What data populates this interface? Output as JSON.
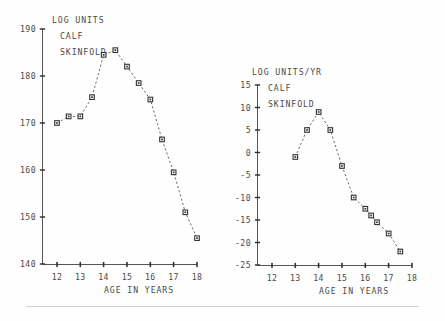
{
  "figure": {
    "background_color": "#fefefe",
    "ink_color": "#4a4a4a",
    "marker_color": "#333333",
    "footer_rule": true
  },
  "chart_data": [
    {
      "type": "line",
      "id": "calf-skinfold-distance",
      "title": "LOG UNITS CALF SKINFOLD",
      "header_lines": [
        "LOG UNITS",
        "CALF",
        "SKINFOLD"
      ],
      "xlabel": "AGE IN YEARS",
      "ylabel": "LOG UNITS",
      "xlim": [
        12,
        18
      ],
      "ylim": [
        140,
        190
      ],
      "xticks": [
        12,
        13,
        14,
        15,
        16,
        17,
        18
      ],
      "xticklabels": [
        "12",
        "13",
        "14",
        "15",
        "16",
        "17",
        "18"
      ],
      "yticks": [
        140,
        150,
        160,
        170,
        180,
        190
      ],
      "yticklabels": [
        "140",
        "150",
        "160",
        "170",
        "180",
        "190"
      ],
      "grid": false,
      "legend": false,
      "linestyle": "dashed",
      "marker": "square",
      "x": [
        12.0,
        12.5,
        13.0,
        13.5,
        14.0,
        14.5,
        15.0,
        15.5,
        16.0,
        16.5,
        17.0,
        17.5,
        18.0
      ],
      "values": [
        170.0,
        171.4,
        171.4,
        175.5,
        184.5,
        185.5,
        182.0,
        178.5,
        175.0,
        166.5,
        159.5,
        151.0,
        145.5
      ]
    },
    {
      "type": "line",
      "id": "calf-skinfold-velocity",
      "title": "LOG UNITS/YR CALF SKINFOLD",
      "header_lines": [
        "LOG UNITS/YR",
        "CALF",
        "SKINFOLD"
      ],
      "xlabel": "AGE IN YEARS",
      "ylabel": "LOG UNITS/YR",
      "xlim": [
        12,
        18
      ],
      "ylim": [
        -25,
        15
      ],
      "xticks": [
        12,
        13,
        14,
        15,
        16,
        17,
        18
      ],
      "xticklabels": [
        "12",
        "13",
        "14",
        "15",
        "16",
        "17",
        "18"
      ],
      "yticks": [
        -25,
        -20,
        -15,
        -10,
        -5,
        0,
        5,
        10,
        15
      ],
      "yticklabels": [
        "-25",
        "-20",
        "-15",
        "-10",
        "-5",
        "0",
        "5",
        "10",
        "15"
      ],
      "grid": false,
      "legend": false,
      "linestyle": "dashed",
      "marker": "square",
      "x": [
        13.0,
        13.5,
        14.0,
        14.5,
        15.0,
        15.5,
        16.0,
        16.25,
        16.5,
        17.0,
        17.5
      ],
      "values": [
        -1.0,
        5.0,
        9.0,
        5.0,
        -3.0,
        -10.0,
        -12.5,
        -14.0,
        -15.5,
        -18.0,
        -22.0
      ]
    }
  ]
}
